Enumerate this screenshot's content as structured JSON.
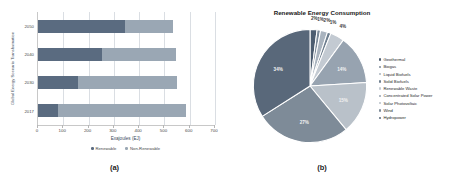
{
  "figure": {
    "panel_a_caption": "(a)",
    "panel_b_caption": "(b)"
  },
  "chart_data": [
    {
      "type": "bar",
      "orientation": "horizontal",
      "stacked": true,
      "title": "",
      "xlabel": "Exajoules (EJ)",
      "ylabel": "Global Energy Scenario Transformation",
      "categories": [
        "2017",
        "2030",
        "2040",
        "2050"
      ],
      "xticks": [
        0,
        100,
        200,
        300,
        400,
        500,
        600,
        700
      ],
      "xlim": [
        0,
        700
      ],
      "grid": true,
      "legend_position": "bottom",
      "series": [
        {
          "name": "Renewable",
          "color": "#5a6b80",
          "values": [
            80,
            160,
            255,
            345
          ]
        },
        {
          "name": "Non-Renewable",
          "color": "#9aa7b4",
          "values": [
            505,
            390,
            290,
            190
          ]
        }
      ]
    },
    {
      "type": "pie",
      "title": "Renewable Energy Consumption",
      "legend_position": "right",
      "labels": [
        "Geothermal",
        "Biogas",
        "Liquid Biofuels",
        "Solid Biofuels",
        "Renewable Waste",
        "Concentrated Solar Power",
        "Solar Photovoltaic",
        "Wind",
        "Hydropower"
      ],
      "values": [
        2,
        1,
        2,
        1,
        4,
        14,
        15,
        27,
        34
      ],
      "value_labels": [
        "2%",
        "1%",
        "2%",
        "1%",
        "4%",
        "14%",
        "15%",
        "27%",
        "34%"
      ],
      "colors": [
        "#4d5d70",
        "#7c8a99",
        "#aab4bf",
        "#6f7f8f",
        "#c3cad2",
        "#97a3b0",
        "#b9c1c9",
        "#7e8b98",
        "#59687a"
      ]
    }
  ]
}
